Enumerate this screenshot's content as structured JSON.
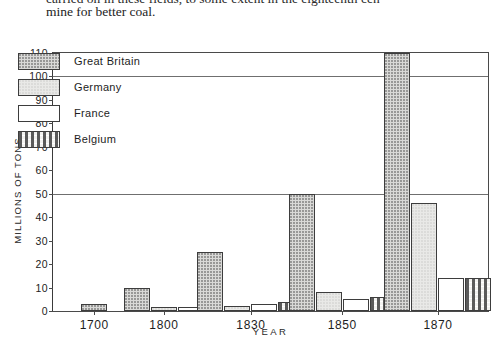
{
  "page_text": {
    "cut_line": "carried on in these fields, to some extent in the eighteenth cen-",
    "line": "mine for better coal."
  },
  "chart_data": {
    "type": "bar",
    "title": "",
    "xlabel": "YEAR",
    "ylabel": "MILLIONS OF TONS",
    "categories": [
      "1700",
      "1800",
      "1830",
      "1850",
      "1870"
    ],
    "ylim": [
      0,
      110
    ],
    "yticks": [
      0,
      10,
      20,
      30,
      40,
      50,
      60,
      70,
      80,
      90,
      100,
      110
    ],
    "gridlines": [
      50,
      100
    ],
    "grid": true,
    "legend_position": "inside-top-left",
    "series": [
      {
        "name": "Great Britain",
        "pattern": "dense-stipple",
        "values": [
          3,
          10,
          25,
          50,
          110
        ]
      },
      {
        "name": "Germany",
        "pattern": "light-stipple",
        "values": [
          0,
          1.5,
          2,
          8,
          46
        ]
      },
      {
        "name": "France",
        "pattern": "plain-white",
        "values": [
          0,
          1.5,
          3,
          5,
          14
        ]
      },
      {
        "name": "Belgium",
        "pattern": "dashed-lines",
        "values": [
          0,
          0,
          4,
          6,
          14
        ]
      }
    ]
  },
  "colors": {
    "axis": "#4a4a4a",
    "grid": "#6f6f6f",
    "great_britain": "#d9d9d7",
    "germany": "#e9e9e7",
    "france": "#ffffff",
    "belgium": "#f2f2f0"
  }
}
